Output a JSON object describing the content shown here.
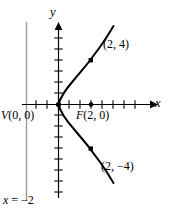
{
  "figure": {
    "background_color": "#ffffff",
    "curve_color": "#000000",
    "axis_color": "#000000",
    "directrix_color": "#9a9a9a"
  },
  "axes": {
    "x_label": "x",
    "y_label": "y",
    "origin_px": {
      "x": 58,
      "y": 104
    },
    "tick_spacing_px": 11,
    "x_axis_start_px": 22,
    "x_axis_end_px": 152,
    "y_axis_top_px": 28,
    "y_axis_bottom_px": 198
  },
  "labels": {
    "vertex": "V(0, 0)",
    "focus": "F(2, 0)",
    "point_upper": "(2, 4)",
    "point_lower": "(2, −4)",
    "directrix": "x = −2"
  },
  "chart_data": {
    "type": "line",
    "title": "",
    "xlabel": "x",
    "ylabel": "y",
    "equation": "y² = 8x",
    "grid": false,
    "legend": null,
    "xlim": [
      -3.3,
      8.5
    ],
    "ylim": [
      -7.0,
      7.0
    ],
    "series": [
      {
        "name": "parabola y² = 8x",
        "x": [
          0.0,
          0.08,
          0.2,
          0.32,
          0.5,
          0.72,
          1.0,
          1.28,
          1.62,
          2.0,
          2.42,
          2.88,
          3.38,
          3.92,
          4.5,
          5.12,
          5.78,
          6.48
        ],
        "y_upper": [
          0.0,
          0.8,
          1.2,
          1.6,
          2.0,
          2.4,
          2.83,
          3.2,
          3.6,
          4.0,
          4.4,
          4.8,
          5.2,
          5.6,
          6.0,
          6.4,
          6.8,
          7.2
        ],
        "y_lower": [
          0.0,
          -0.8,
          -1.2,
          -1.6,
          -2.0,
          -2.4,
          -2.83,
          -3.2,
          -3.6,
          -4.0,
          -4.4,
          -4.8,
          -5.2,
          -5.6,
          -6.0,
          -6.4,
          -6.8,
          -7.2
        ]
      }
    ],
    "annotations": [
      {
        "label": "V(0, 0)",
        "x": 0,
        "y": 0,
        "marker": "dot",
        "role": "vertex"
      },
      {
        "label": "F(2, 0)",
        "x": 2,
        "y": 0,
        "marker": "dot",
        "role": "focus"
      },
      {
        "label": "(2, 4)",
        "x": 2,
        "y": 4,
        "marker": "square",
        "role": "point"
      },
      {
        "label": "(2, −4)",
        "x": 2,
        "y": -4,
        "marker": "square",
        "role": "point"
      },
      {
        "label": "x = −2",
        "x": -2,
        "y": null,
        "marker": "vertical-line",
        "role": "directrix"
      }
    ]
  }
}
